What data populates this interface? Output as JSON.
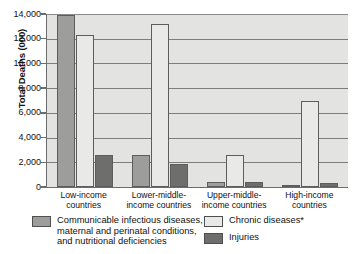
{
  "chart_data": {
    "type": "bar",
    "title": "",
    "xlabel": "",
    "ylabel": "Total Deaths (000)",
    "ylim": [
      0,
      14000
    ],
    "ytick_values": [
      14000,
      12000,
      10000,
      8000,
      6000,
      4000,
      2000,
      0
    ],
    "ytick_labels": [
      "14,000",
      "12,000",
      "10,000",
      "8,000",
      "6,000",
      "4,000",
      "2,000",
      "0"
    ],
    "grid": true,
    "legend_position": "bottom",
    "categories": [
      "Low-income countries",
      "Lower-middle-income countries",
      "Upper-middle-income countries",
      "High-income countries"
    ],
    "category_label_lines": [
      [
        "Low-income",
        "countries"
      ],
      [
        "Lower-middle-",
        "income countries"
      ],
      [
        "Upper-middle-",
        "income countries"
      ],
      [
        "High-income",
        "countries"
      ]
    ],
    "series": [
      {
        "name": "Communicable infectious diseases, maternal and perinatal conditions, and nutritional deficiencies",
        "key": "communicable",
        "color": "#9d9d9b",
        "values": [
          13900,
          2600,
          400,
          200
        ]
      },
      {
        "name": "Chronic diseases*",
        "key": "chronic",
        "color": "#e9e9e7",
        "values": [
          12300,
          13200,
          2600,
          6950
        ]
      },
      {
        "name": "Injuries",
        "key": "injuries",
        "color": "#6e6e6c",
        "values": [
          2600,
          1900,
          400,
          350
        ]
      }
    ]
  },
  "legend": {
    "entries": [
      {
        "key": "communicable",
        "lines": [
          "Communicable infectious diseases,",
          "maternal and perinatal conditions,",
          "and nutritional deficiencies"
        ]
      },
      {
        "key": "chronic",
        "lines": [
          "Chronic diseases*"
        ]
      },
      {
        "key": "injuries",
        "lines": [
          "Injuries"
        ]
      }
    ]
  }
}
